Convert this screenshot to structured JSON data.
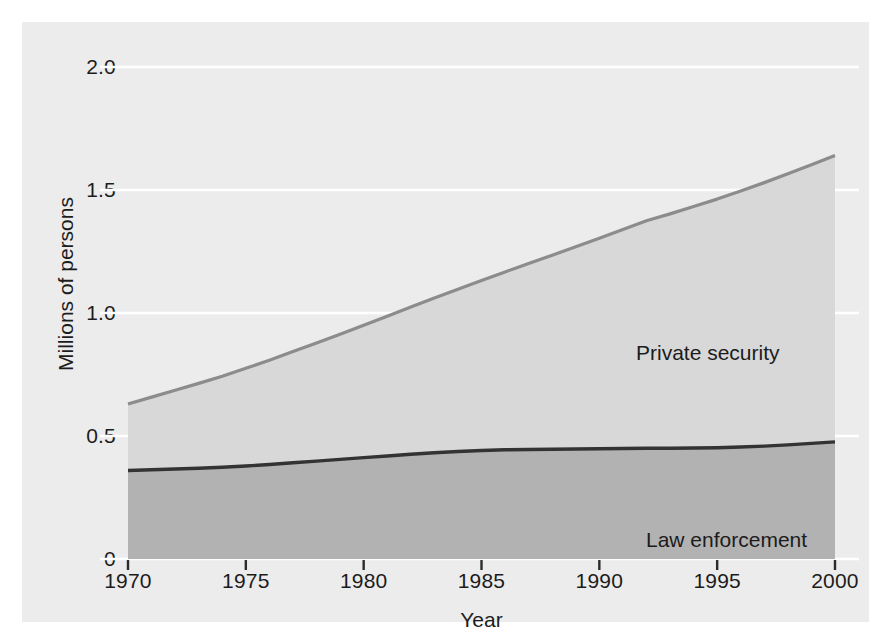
{
  "chart_data": {
    "type": "area",
    "stacked": true,
    "title": "",
    "subtitle": "",
    "xlabel": "Year",
    "ylabel": "Millions of persons",
    "xlim": [
      1970,
      2000
    ],
    "ylim": [
      0,
      2.0
    ],
    "x_ticks": [
      1970,
      1975,
      1980,
      1985,
      1990,
      1995,
      2000
    ],
    "x_tick_labels": [
      "1970",
      "1975",
      "1980",
      "1985",
      "1990",
      "1995",
      "2000"
    ],
    "y_ticks": [
      0,
      0.5,
      1.0,
      1.5,
      2.0
    ],
    "y_tick_labels": [
      "0",
      "0.5",
      "1.0",
      "1.5",
      "2.0"
    ],
    "grid": "horizontal",
    "grid_color": "#ffffff",
    "legend_position": "inline-annotations",
    "plot_background": "#ececec",
    "figure_background": "#ffffff",
    "x": [
      1970,
      1971,
      1972,
      1973,
      1974,
      1975,
      1976,
      1977,
      1978,
      1979,
      1980,
      1981,
      1982,
      1983,
      1984,
      1985,
      1986,
      1987,
      1988,
      1989,
      1990,
      1991,
      1992,
      1993,
      1994,
      1995,
      1996,
      1997,
      1998,
      1999,
      2000
    ],
    "series": [
      {
        "name": "Law enforcement",
        "color": "#b2b2b2",
        "line_color": "#333333",
        "annotation": "Law enforcement",
        "values": [
          0.36,
          0.363,
          0.366,
          0.369,
          0.373,
          0.378,
          0.384,
          0.391,
          0.398,
          0.405,
          0.412,
          0.419,
          0.426,
          0.432,
          0.437,
          0.441,
          0.444,
          0.445,
          0.446,
          0.447,
          0.448,
          0.449,
          0.45,
          0.45,
          0.451,
          0.452,
          0.455,
          0.459,
          0.464,
          0.47,
          0.476
        ]
      },
      {
        "name": "Private security",
        "color": "#d8d8d8",
        "line_color": "#8c8c8c",
        "annotation": "Private security",
        "values": [
          0.27,
          0.295,
          0.32,
          0.345,
          0.37,
          0.397,
          0.424,
          0.452,
          0.48,
          0.509,
          0.538,
          0.568,
          0.598,
          0.629,
          0.66,
          0.691,
          0.723,
          0.756,
          0.789,
          0.822,
          0.856,
          0.89,
          0.925,
          0.953,
          0.982,
          1.011,
          1.041,
          1.071,
          1.102,
          1.133,
          1.164
        ]
      }
    ],
    "totals": [
      0.63,
      0.658,
      0.686,
      0.714,
      0.743,
      0.775,
      0.808,
      0.843,
      0.878,
      0.914,
      0.95,
      0.987,
      1.024,
      1.061,
      1.097,
      1.132,
      1.167,
      1.201,
      1.235,
      1.269,
      1.304,
      1.339,
      1.375,
      1.403,
      1.433,
      1.463,
      1.496,
      1.53,
      1.566,
      1.603,
      1.64
    ]
  }
}
